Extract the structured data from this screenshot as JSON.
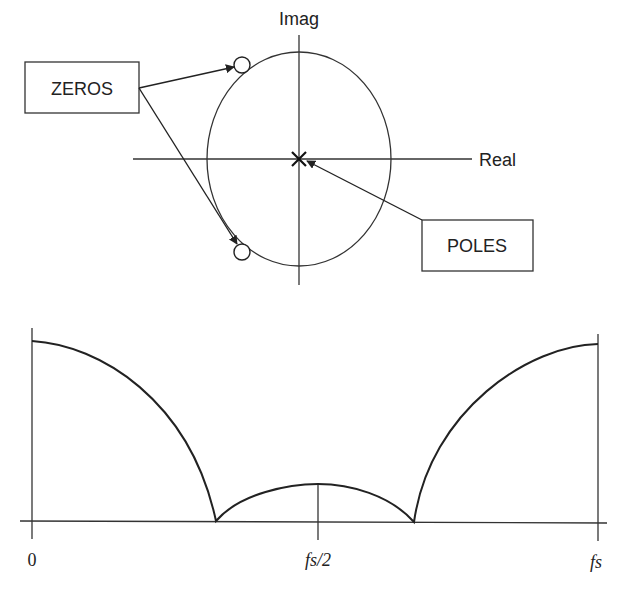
{
  "pole_zero_plot": {
    "axis_labels": {
      "imag": "Imag",
      "real": "Real"
    },
    "callouts": {
      "zeros": "ZEROS",
      "poles": "POLES"
    },
    "markers": {
      "zero_symbol": "circle",
      "pole_symbol": "cross",
      "zero_count": 2,
      "pole_count": 1,
      "pole_location": "origin"
    }
  },
  "frequency_response": {
    "x_ticks": {
      "start": "0",
      "mid": "fs/2",
      "end": "fs"
    }
  },
  "colors": {
    "ink": "#222222",
    "background": "#ffffff"
  }
}
